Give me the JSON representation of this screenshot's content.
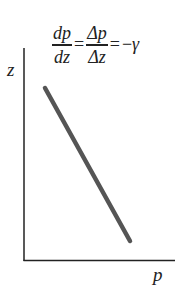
{
  "equation": {
    "frac1": {
      "numerator": "dp",
      "denominator": "dz"
    },
    "equals1": "=",
    "frac2": {
      "numerator": "Δp",
      "denominator": "Δz"
    },
    "equals2": "=",
    "rhs_sign": "−",
    "rhs_symbol": "γ"
  },
  "axes": {
    "y_label": "z",
    "x_label": "p",
    "color": "#222222"
  },
  "line": {
    "color": "#555555",
    "description": "straight line with negative slope"
  }
}
